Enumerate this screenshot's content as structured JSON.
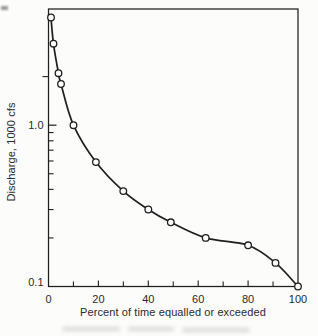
{
  "figure": {
    "background": "#fcfcfb",
    "ink": "#1f1f1f",
    "text_color": "#2a2a2a"
  },
  "chart_data": {
    "type": "line",
    "title": "",
    "xlabel": "Percent of time equalled or exceeded",
    "ylabel": "Discharge, 1000 cfs",
    "x": [
      1,
      2,
      4,
      5,
      10,
      19,
      30,
      40,
      49,
      63,
      80,
      91,
      100
    ],
    "y": [
      4.65,
      3.2,
      2.1,
      1.8,
      1.0,
      0.59,
      0.39,
      0.3,
      0.25,
      0.2,
      0.18,
      0.14,
      0.1
    ],
    "marker": "open-circle",
    "grid": false,
    "legend": false,
    "x_axis": {
      "min": 0,
      "max": 100,
      "major_ticks": [
        0,
        20,
        40,
        60,
        80,
        100
      ],
      "minor_ticks": [
        10,
        30,
        50,
        70,
        90
      ],
      "tick_labels": [
        "0",
        "20",
        "40",
        "60",
        "80",
        "100"
      ]
    },
    "y_axis": {
      "scale": "log",
      "min": 0.1,
      "max": 5.25,
      "labeled_ticks": [
        {
          "value": 1.0,
          "label": "1.0"
        },
        {
          "value": 0.1,
          "label": "0.1"
        }
      ],
      "inside_minor_ticks": [
        0.2,
        0.3,
        0.4,
        0.5,
        0.6,
        0.7,
        0.8,
        0.9
      ],
      "outside_minor_ticks": [
        2.0
      ]
    }
  }
}
